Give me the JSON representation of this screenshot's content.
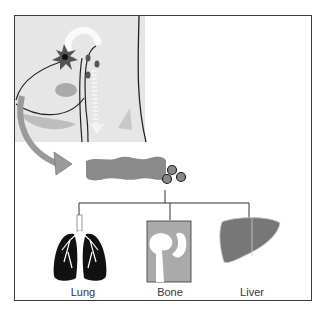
{
  "figure": {
    "type": "metastasis-pathway-diagram",
    "panels": {
      "primary_site": {
        "icon": "torso-tumor-illustration",
        "description": "Primary tumor with tumor cells entering circulation"
      },
      "circulation": {
        "icon": "blood-vessel-with-tumor-cells",
        "description": "Circulating tumor cells exiting vessel"
      },
      "targets": [
        {
          "label": "Lung",
          "icon": "lung-icon"
        },
        {
          "label": "Bone",
          "icon": "bone-icon"
        },
        {
          "label": "Liver",
          "icon": "liver-icon"
        }
      ]
    },
    "colors": {
      "frame": "#3a3a3a",
      "panel_bg": "#e6e6e6",
      "organ_gray": "#8a8a8a",
      "dark": "#111111",
      "arrow": "#9a9a9a"
    }
  }
}
